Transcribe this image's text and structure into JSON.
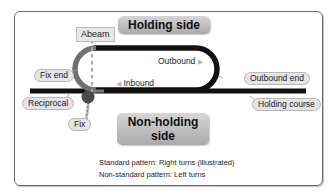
{
  "diagram": {
    "sides": {
      "holding": "Holding side",
      "non_holding": "Non-holding side"
    },
    "labels": {
      "abeam": "Abeam",
      "fix_end": "Fix end",
      "outbound_end": "Outbound end",
      "reciprocal": "Reciprocal",
      "holding_course": "Holding course",
      "fix": "Fix"
    },
    "legs": {
      "outbound": "Outbound",
      "inbound": "Inbound"
    },
    "arrows": {
      "outbound_arrow": "▶",
      "inbound_arrow": "◀"
    },
    "notes": {
      "standard": "Standard pattern: Right turns (illustrated)",
      "non_standard": "Non-standard pattern: Left turns"
    },
    "colors": {
      "track_black": "#111111",
      "track_gray": "#6e6e6e",
      "fix": "#4a4a4a",
      "label_bg": "#e4e4e4"
    }
  }
}
